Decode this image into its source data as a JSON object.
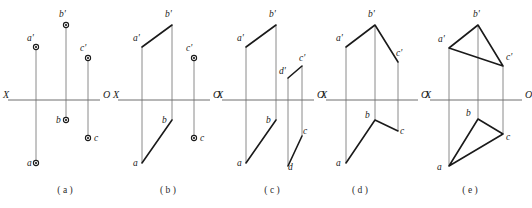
{
  "figure": {
    "title": "",
    "background_color": "#ffffff",
    "line_color": "#1a1a1a",
    "axis_color": "#6f6f6f",
    "projector_color": "#8a8a8a",
    "axis_left_label": "X",
    "axis_right_label": "O"
  },
  "panels": [
    {
      "id": "a",
      "caption": "( a )",
      "caption_x": 65,
      "caption_y": 193,
      "axis": {
        "x1": 8,
        "x2": 100,
        "y": 100,
        "left_label": "X",
        "right_label": "O",
        "left_label_x": 3,
        "left_label_y": 98,
        "right_label_x": 103,
        "right_label_y": 98
      },
      "points": [
        {
          "name": "b'",
          "label": "b'",
          "x": 66,
          "y": 25,
          "label_x": 59,
          "label_y": 17
        },
        {
          "name": "a'",
          "label": "a'",
          "x": 36,
          "y": 47,
          "label_x": 27,
          "label_y": 41
        },
        {
          "name": "c'",
          "label": "c'",
          "x": 88,
          "y": 58,
          "label_x": 80,
          "label_y": 51
        },
        {
          "name": "b",
          "label": "b",
          "x": 66,
          "y": 120,
          "label_x": 56,
          "label_y": 123
        },
        {
          "name": "c",
          "label": "c",
          "x": 88,
          "y": 138,
          "label_x": 94,
          "label_y": 141
        },
        {
          "name": "a",
          "label": "a",
          "x": 36,
          "y": 163,
          "label_x": 27,
          "label_y": 166
        }
      ],
      "projectors": [
        {
          "x1": 36,
          "y1": 47,
          "x2": 36,
          "y2": 163
        },
        {
          "x1": 66,
          "y1": 25,
          "x2": 66,
          "y2": 120
        },
        {
          "x1": 88,
          "y1": 58,
          "x2": 88,
          "y2": 138
        }
      ],
      "edges": []
    },
    {
      "id": "b",
      "caption": "( b )",
      "caption_x": 168,
      "caption_y": 193,
      "axis": {
        "x1": 118,
        "x2": 210,
        "y": 100,
        "left_label": "X",
        "right_label": "O",
        "left_label_x": 113,
        "left_label_y": 98,
        "right_label_x": 213,
        "right_label_y": 98
      },
      "points": [
        {
          "name": "c'",
          "label": "c'",
          "x": 194,
          "y": 58,
          "label_x": 186,
          "label_y": 51
        },
        {
          "name": "c",
          "label": "c",
          "x": 194,
          "y": 138,
          "label_x": 200,
          "label_y": 141
        }
      ],
      "labels": [
        {
          "name": "b'",
          "text": "b'",
          "x": 165,
          "y": 17
        },
        {
          "name": "a'",
          "text": "a'",
          "x": 133,
          "y": 41
        },
        {
          "name": "b",
          "text": "b",
          "x": 162,
          "y": 123
        },
        {
          "name": "a",
          "text": "a",
          "x": 133,
          "y": 166
        }
      ],
      "projectors": [
        {
          "x1": 142,
          "y1": 47,
          "x2": 142,
          "y2": 163
        },
        {
          "x1": 172,
          "y1": 25,
          "x2": 172,
          "y2": 120
        },
        {
          "x1": 194,
          "y1": 58,
          "x2": 194,
          "y2": 138
        }
      ],
      "edges": [
        {
          "name": "edge-a-prime-b-prime",
          "points": "142,47 172,25"
        },
        {
          "name": "edge-b-a",
          "points": "172,120 142,163"
        }
      ]
    },
    {
      "id": "c",
      "caption": "( c )",
      "caption_x": 272,
      "caption_y": 193,
      "axis": {
        "x1": 222,
        "x2": 314,
        "y": 100,
        "left_label": "X",
        "right_label": "O",
        "left_label_x": 217,
        "left_label_y": 98,
        "right_label_x": 317,
        "right_label_y": 98
      },
      "points": [],
      "labels": [
        {
          "name": "b'",
          "text": "b'",
          "x": 269,
          "y": 17
        },
        {
          "name": "a'",
          "text": "a'",
          "x": 237,
          "y": 41
        },
        {
          "name": "d'",
          "text": "d'",
          "x": 279,
          "y": 74
        },
        {
          "name": "c'",
          "text": "c'",
          "x": 299,
          "y": 61
        },
        {
          "name": "b",
          "text": "b",
          "x": 266,
          "y": 123
        },
        {
          "name": "c",
          "text": "c",
          "x": 303,
          "y": 134
        },
        {
          "name": "a",
          "text": "a",
          "x": 237,
          "y": 166
        },
        {
          "name": "d",
          "text": "d",
          "x": 288,
          "y": 170
        }
      ],
      "projectors": [
        {
          "x1": 246,
          "y1": 47,
          "x2": 246,
          "y2": 163
        },
        {
          "x1": 276,
          "y1": 25,
          "x2": 276,
          "y2": 120
        },
        {
          "x1": 288,
          "y1": 78,
          "x2": 288,
          "y2": 166
        },
        {
          "x1": 302,
          "y1": 66,
          "x2": 302,
          "y2": 136
        }
      ],
      "edges": [
        {
          "name": "edge-a-prime-b-prime",
          "points": "246,47 276,25"
        },
        {
          "name": "edge-b-a",
          "points": "276,120 246,163"
        },
        {
          "name": "edge-d-prime-c-prime",
          "points": "288,78 302,66"
        },
        {
          "name": "edge-d-c",
          "points": "288,166 302,136"
        }
      ]
    },
    {
      "id": "d",
      "caption": "( d )",
      "caption_x": 360,
      "caption_y": 193,
      "axis": {
        "x1": 326,
        "x2": 418,
        "y": 100,
        "left_label": "X",
        "right_label": "O",
        "left_label_x": 321,
        "left_label_y": 98,
        "right_label_x": 421,
        "right_label_y": 98
      },
      "points": [],
      "labels": [
        {
          "name": "b'",
          "text": "b'",
          "x": 368,
          "y": 17
        },
        {
          "name": "a'",
          "text": "a'",
          "x": 336,
          "y": 41
        },
        {
          "name": "c'",
          "text": "c'",
          "x": 396,
          "y": 56
        },
        {
          "name": "b",
          "text": "b",
          "x": 365,
          "y": 118
        },
        {
          "name": "c",
          "text": "c",
          "x": 400,
          "y": 134
        },
        {
          "name": "a",
          "text": "a",
          "x": 336,
          "y": 166
        }
      ],
      "projectors": [
        {
          "x1": 346,
          "y1": 47,
          "x2": 346,
          "y2": 163
        },
        {
          "x1": 375,
          "y1": 25,
          "x2": 375,
          "y2": 120
        },
        {
          "x1": 398,
          "y1": 62,
          "x2": 398,
          "y2": 131
        }
      ],
      "edges": [
        {
          "name": "edge-a-prime-b-prime-c-prime",
          "points": "346,47 375,25 398,62"
        },
        {
          "name": "edge-a-b-c",
          "points": "346,163 375,120 398,131"
        }
      ]
    },
    {
      "id": "e",
      "caption": "( e )",
      "caption_x": 470,
      "caption_y": 193,
      "axis": {
        "x1": 430,
        "x2": 522,
        "y": 100,
        "left_label": "X",
        "right_label": "O",
        "left_label_x": 425,
        "left_label_y": 98,
        "right_label_x": 525,
        "right_label_y": 98
      },
      "points": [],
      "labels": [
        {
          "name": "b'",
          "text": "b'",
          "x": 473,
          "y": 17
        },
        {
          "name": "a'",
          "text": "a'",
          "x": 438,
          "y": 42
        },
        {
          "name": "c'",
          "text": "c'",
          "x": 506,
          "y": 60
        },
        {
          "name": "b",
          "text": "b",
          "x": 466,
          "y": 116
        },
        {
          "name": "c",
          "text": "c",
          "x": 506,
          "y": 140
        },
        {
          "name": "a",
          "text": "a",
          "x": 437,
          "y": 170
        }
      ],
      "projectors": [
        {
          "x1": 449,
          "y1": 48,
          "x2": 449,
          "y2": 166
        },
        {
          "x1": 478,
          "y1": 25,
          "x2": 478,
          "y2": 119
        },
        {
          "x1": 503,
          "y1": 66,
          "x2": 503,
          "y2": 134
        }
      ],
      "edges": [
        {
          "name": "edge-triangle-upper",
          "points": "449,48 478,25 503,66 449,48"
        },
        {
          "name": "edge-triangle-lower",
          "points": "449,166 478,119 503,134 449,166"
        }
      ]
    }
  ]
}
